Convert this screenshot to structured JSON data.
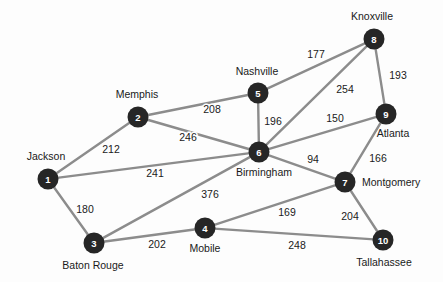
{
  "figure": {
    "name": "weighted-city-network-graph",
    "background_color": "#fdfdfd",
    "node_color": "#262626",
    "node_text_color": "#ffffff",
    "edge_color": "#8c8c8c",
    "label_color": "#1a1a1a"
  },
  "chart_data": {
    "type": "diagram",
    "subtype": "undirected-weighted-graph",
    "title": "",
    "xlabel": "",
    "ylabel": "",
    "nodes": [
      {
        "id": "1",
        "label": "Jackson",
        "x": 48,
        "y": 179,
        "label_x": 46,
        "label_y": 157,
        "label_anchor": "middle"
      },
      {
        "id": "2",
        "label": "Memphis",
        "x": 138,
        "y": 117,
        "label_x": 137,
        "label_y": 95,
        "label_anchor": "middle"
      },
      {
        "id": "3",
        "label": "Baton Rouge",
        "x": 94,
        "y": 243,
        "label_x": 93,
        "label_y": 266,
        "label_anchor": "middle"
      },
      {
        "id": "4",
        "label": "Mobile",
        "x": 205,
        "y": 228,
        "label_x": 205,
        "label_y": 249,
        "label_anchor": "middle"
      },
      {
        "id": "5",
        "label": "Nashville",
        "x": 258,
        "y": 93,
        "label_x": 257,
        "label_y": 72,
        "label_anchor": "middle"
      },
      {
        "id": "6",
        "label": "Birmingham",
        "x": 259,
        "y": 152,
        "label_x": 264,
        "label_y": 173,
        "label_anchor": "middle"
      },
      {
        "id": "7",
        "label": "Montgomery",
        "x": 345,
        "y": 182,
        "label_x": 362,
        "label_y": 183,
        "label_anchor": "start"
      },
      {
        "id": "8",
        "label": "Knoxville",
        "x": 374,
        "y": 39,
        "label_x": 372,
        "label_y": 17,
        "label_anchor": "middle"
      },
      {
        "id": "9",
        "label": "Atlanta",
        "x": 386,
        "y": 114,
        "label_x": 393,
        "label_y": 134,
        "label_anchor": "middle"
      },
      {
        "id": "10",
        "label": "Tallahassee",
        "x": 383,
        "y": 240,
        "label_x": 384,
        "label_y": 263,
        "label_anchor": "middle"
      }
    ],
    "edges": [
      {
        "source": "1",
        "target": "2",
        "weight": 212,
        "label_x": 111,
        "label_y": 150
      },
      {
        "source": "1",
        "target": "6",
        "weight": 241,
        "label_x": 155,
        "label_y": 174
      },
      {
        "source": "1",
        "target": "3",
        "weight": 180,
        "label_x": 85,
        "label_y": 210
      },
      {
        "source": "2",
        "target": "5",
        "weight": 208,
        "label_x": 212,
        "label_y": 110
      },
      {
        "source": "2",
        "target": "6",
        "weight": 246,
        "label_x": 188,
        "label_y": 138
      },
      {
        "source": "5",
        "target": "6",
        "weight": 196,
        "label_x": 273,
        "label_y": 122
      },
      {
        "source": "5",
        "target": "8",
        "weight": 177,
        "label_x": 316,
        "label_y": 55
      },
      {
        "source": "6",
        "target": "8",
        "weight": 254,
        "label_x": 345,
        "label_y": 90
      },
      {
        "source": "6",
        "target": "9",
        "weight": 150,
        "label_x": 335,
        "label_y": 119
      },
      {
        "source": "6",
        "target": "7",
        "weight": 94,
        "label_x": 313,
        "label_y": 160
      },
      {
        "source": "6",
        "target": "3",
        "weight": 376,
        "label_x": 210,
        "label_y": 195
      },
      {
        "source": "8",
        "target": "9",
        "weight": 193,
        "label_x": 398,
        "label_y": 76
      },
      {
        "source": "9",
        "target": "7",
        "weight": 166,
        "label_x": 378,
        "label_y": 159
      },
      {
        "source": "7",
        "target": "4",
        "weight": 169,
        "label_x": 287,
        "label_y": 213
      },
      {
        "source": "7",
        "target": "10",
        "weight": 204,
        "label_x": 350,
        "label_y": 217
      },
      {
        "source": "3",
        "target": "4",
        "weight": 202,
        "label_x": 157,
        "label_y": 245
      },
      {
        "source": "4",
        "target": "10",
        "weight": 248,
        "label_x": 297,
        "label_y": 246
      }
    ],
    "node_radius": 10.5,
    "legend": null,
    "grid": false
  }
}
